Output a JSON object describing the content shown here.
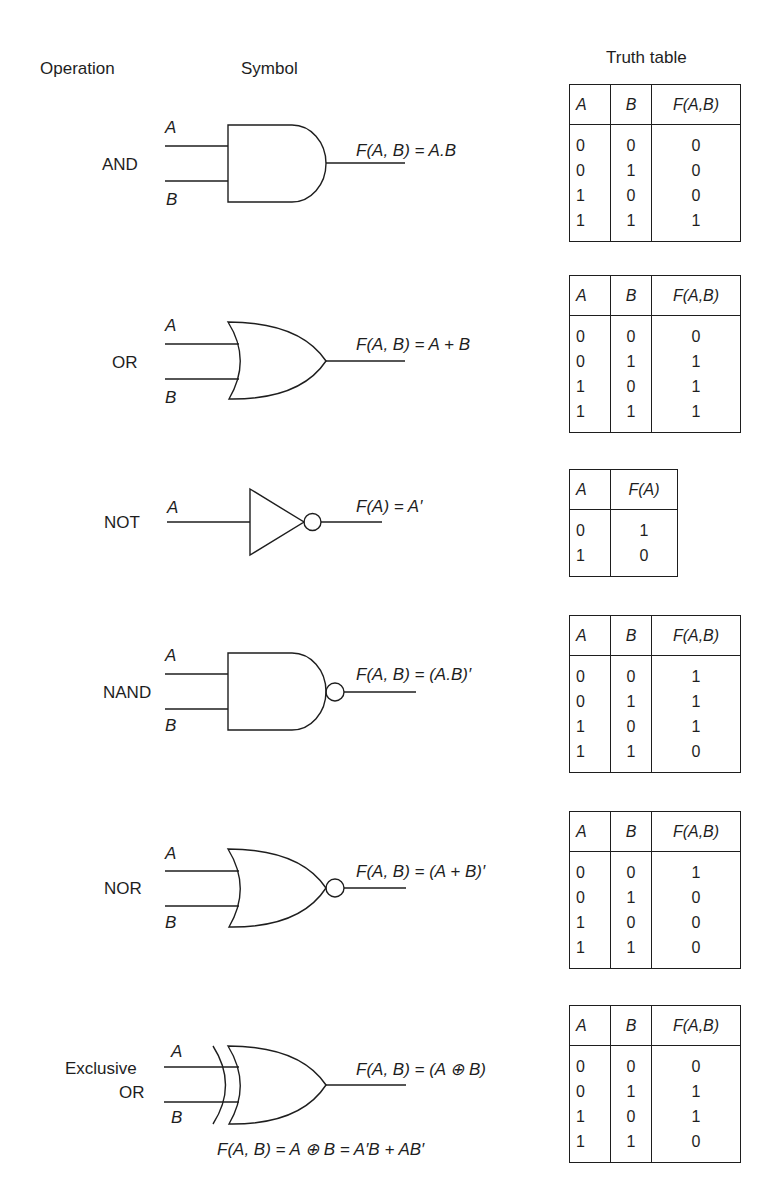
{
  "headers": {
    "operation": "Operation",
    "symbol": "Symbol",
    "truth_table": "Truth table"
  },
  "gates": [
    {
      "operation": "AND",
      "input_a": "A",
      "input_b": "B",
      "equation": "F(A, B) = A.B",
      "table": {
        "columns": [
          "A",
          "B",
          "F(A,B)"
        ],
        "rows": [
          [
            "0",
            "0",
            "0"
          ],
          [
            "0",
            "1",
            "0"
          ],
          [
            "1",
            "0",
            "0"
          ],
          [
            "1",
            "1",
            "1"
          ]
        ]
      }
    },
    {
      "operation": "OR",
      "input_a": "A",
      "input_b": "B",
      "equation": "F(A, B) = A + B",
      "table": {
        "columns": [
          "A",
          "B",
          "F(A,B)"
        ],
        "rows": [
          [
            "0",
            "0",
            "0"
          ],
          [
            "0",
            "1",
            "1"
          ],
          [
            "1",
            "0",
            "1"
          ],
          [
            "1",
            "1",
            "1"
          ]
        ]
      }
    },
    {
      "operation": "NOT",
      "input_a": "A",
      "equation": "F(A) = A′",
      "table": {
        "columns": [
          "A",
          "F(A)"
        ],
        "rows": [
          [
            "0",
            "1"
          ],
          [
            "1",
            "0"
          ]
        ]
      }
    },
    {
      "operation": "NAND",
      "input_a": "A",
      "input_b": "B",
      "equation": "F(A, B) = (A.B)′",
      "table": {
        "columns": [
          "A",
          "B",
          "F(A,B)"
        ],
        "rows": [
          [
            "0",
            "0",
            "1"
          ],
          [
            "0",
            "1",
            "1"
          ],
          [
            "1",
            "0",
            "1"
          ],
          [
            "1",
            "1",
            "0"
          ]
        ]
      }
    },
    {
      "operation": "NOR",
      "input_a": "A",
      "input_b": "B",
      "equation": "F(A, B) = (A + B)′",
      "table": {
        "columns": [
          "A",
          "B",
          "F(A,B)"
        ],
        "rows": [
          [
            "0",
            "0",
            "1"
          ],
          [
            "0",
            "1",
            "0"
          ],
          [
            "1",
            "0",
            "0"
          ],
          [
            "1",
            "1",
            "0"
          ]
        ]
      }
    },
    {
      "operation_line1": "Exclusive",
      "operation_line2": "OR",
      "input_a": "A",
      "input_b": "B",
      "equation": "F(A, B) = (A ⊕ B)",
      "equation_expanded": "F(A, B) = A ⊕ B = A′B + AB′",
      "table": {
        "columns": [
          "A",
          "B",
          "F(A,B)"
        ],
        "rows": [
          [
            "0",
            "0",
            "0"
          ],
          [
            "0",
            "1",
            "1"
          ],
          [
            "1",
            "0",
            "1"
          ],
          [
            "1",
            "1",
            "0"
          ]
        ]
      }
    }
  ]
}
